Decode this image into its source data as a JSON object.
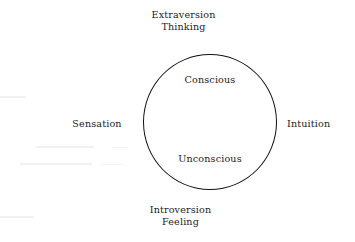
{
  "diagram": {
    "type": "concentric-label-diagram",
    "background_color": "#ffffff",
    "stroke_color": "#111111",
    "text_color": "#1c1c1c",
    "circle": {
      "name": "psyche-circle",
      "center_x": 210,
      "center_y": 122,
      "diameter": 136
    },
    "inner_labels": {
      "top": "Conscious",
      "bottom": "Unconscious"
    },
    "outer_labels": {
      "top": {
        "line1": "Extraversion",
        "line2": "Thinking"
      },
      "bottom": {
        "line1": "Introversion",
        "line2": "Feeling"
      },
      "left": "Sensation",
      "right": "Intuition"
    }
  }
}
